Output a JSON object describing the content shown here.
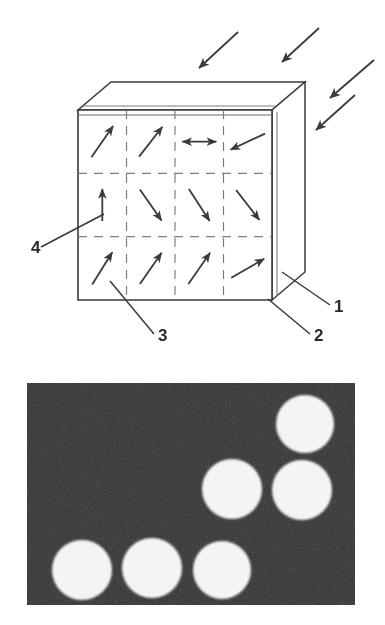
{
  "figure": {
    "panels": [
      {
        "id": "diagram",
        "kind": "line-drawing",
        "description": "Isometric slab divided into a 4x3 grid of cells, each containing a magnetization direction arrow; three external incident arrows approach from the upper right."
      },
      {
        "id": "photograph",
        "kind": "grayscale-micrograph",
        "description": "Dark rectangular field containing six bright circular spots."
      }
    ]
  },
  "diagram": {
    "callouts": [
      {
        "id": "callout-1",
        "label": "1",
        "text_x": 334,
        "text_y": 312,
        "leader": [
          [
            330,
            305
          ],
          [
            282,
            272
          ]
        ]
      },
      {
        "id": "callout-2",
        "label": "2",
        "text_x": 314,
        "text_y": 341,
        "leader": [
          [
            310,
            334
          ],
          [
            268,
            299
          ]
        ]
      },
      {
        "id": "callout-3",
        "label": "3",
        "text_x": 158,
        "text_y": 341,
        "leader": [
          [
            154,
            334
          ],
          [
            110,
            281
          ]
        ]
      },
      {
        "id": "callout-4",
        "label": "4",
        "text_x": 31,
        "text_y": 253,
        "leader": [
          [
            41,
            247
          ],
          [
            104,
            214
          ]
        ]
      }
    ],
    "slab": {
      "front_face": {
        "x0": 78,
        "y0": 110,
        "x1": 272,
        "y1": 300
      },
      "depth_dx": 33,
      "depth_dy": -28,
      "grid_cols": 4,
      "grid_rows": 3,
      "stroke": "#3a3a3a",
      "fill": "#ffffff"
    },
    "incident_arrows": [
      {
        "id": "incident-arrow-a",
        "x1": 238,
        "y1": 32,
        "x2": 199,
        "y2": 68
      },
      {
        "id": "incident-arrow-b",
        "x1": 319,
        "y1": 28,
        "x2": 282,
        "y2": 62
      },
      {
        "id": "incident-arrow-c",
        "x1": 374,
        "y1": 60,
        "x2": 330,
        "y2": 98
      },
      {
        "id": "incident-arrow-d",
        "x1": 355,
        "y1": 95,
        "x2": 316,
        "y2": 130
      }
    ],
    "cell_arrows": [
      {
        "id": "cell-arrow-r1c1",
        "row": 1,
        "col": 1,
        "kind": "single",
        "angle_deg": 55,
        "length": 38
      },
      {
        "id": "cell-arrow-r1c2",
        "row": 1,
        "col": 2,
        "kind": "single",
        "angle_deg": 52,
        "length": 38
      },
      {
        "id": "cell-arrow-r1c3",
        "row": 1,
        "col": 3,
        "kind": "double",
        "angle_deg": 0,
        "length": 34
      },
      {
        "id": "cell-arrow-r1c4",
        "row": 1,
        "col": 4,
        "kind": "single",
        "angle_deg": 205,
        "length": 38
      },
      {
        "id": "cell-arrow-r2c1",
        "row": 2,
        "col": 1,
        "kind": "single",
        "angle_deg": 90,
        "length": 32
      },
      {
        "id": "cell-arrow-r2c2",
        "row": 2,
        "col": 2,
        "kind": "single",
        "angle_deg": 305,
        "length": 38
      },
      {
        "id": "cell-arrow-r2c3",
        "row": 2,
        "col": 3,
        "kind": "single",
        "angle_deg": 303,
        "length": 38
      },
      {
        "id": "cell-arrow-r2c4",
        "row": 2,
        "col": 4,
        "kind": "single",
        "angle_deg": 308,
        "length": 38
      },
      {
        "id": "cell-arrow-r3c1",
        "row": 3,
        "col": 1,
        "kind": "single",
        "angle_deg": 58,
        "length": 38
      },
      {
        "id": "cell-arrow-r3c2",
        "row": 3,
        "col": 2,
        "kind": "single",
        "angle_deg": 55,
        "length": 38
      },
      {
        "id": "cell-arrow-r3c3",
        "row": 3,
        "col": 3,
        "kind": "single",
        "angle_deg": 55,
        "length": 38
      },
      {
        "id": "cell-arrow-r3c4",
        "row": 3,
        "col": 4,
        "kind": "single",
        "angle_deg": 30,
        "length": 38
      }
    ]
  },
  "photograph": {
    "frame": {
      "x": 27,
      "y": 383,
      "width": 328,
      "height": 222
    },
    "background_color": "#1e1e1e",
    "spot_color": "#f2f2f0",
    "spots": [
      {
        "id": "spot-top-right",
        "cx": 305,
        "cy": 424,
        "r": 29
      },
      {
        "id": "spot-mid-center",
        "cx": 232,
        "cy": 489,
        "r": 30
      },
      {
        "id": "spot-mid-right",
        "cx": 302,
        "cy": 490,
        "r": 30
      },
      {
        "id": "spot-bottom-left",
        "cx": 82,
        "cy": 570,
        "r": 30
      },
      {
        "id": "spot-bottom-mid",
        "cx": 152,
        "cy": 568,
        "r": 30
      },
      {
        "id": "spot-bottom-right",
        "cx": 222,
        "cy": 570,
        "r": 29
      }
    ]
  }
}
